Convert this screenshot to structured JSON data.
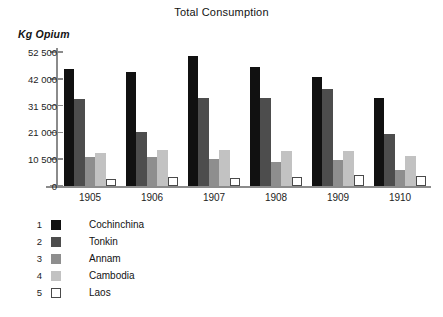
{
  "chart_data": {
    "type": "bar",
    "title": "Total Consumption",
    "xlabel": "",
    "ylabel": "Kg Opium",
    "ylim": [
      0,
      52500
    ],
    "yticks": [
      0,
      10500,
      21000,
      31500,
      42000,
      52500
    ],
    "ytick_labels": [
      "0",
      "10 500",
      "21 000",
      "31 500",
      "42 000",
      "52 500"
    ],
    "grid": false,
    "legend_position": "below-left",
    "categories": [
      "1905",
      "1906",
      "1907",
      "1908",
      "1909",
      "1910"
    ],
    "series": [
      {
        "name": "Cochinchina",
        "number": "1",
        "color": "#111111",
        "values": [
          46000,
          44800,
          51000,
          46800,
          42800,
          34500
        ]
      },
      {
        "name": "Tonkin",
        "number": "2",
        "color": "#4d4d4d",
        "values": [
          34000,
          21000,
          34500,
          34300,
          38000,
          20200
        ]
      },
      {
        "name": "Annam",
        "number": "3",
        "color": "#8e8e8e",
        "values": [
          11300,
          11300,
          10500,
          9500,
          10000,
          6200
        ]
      },
      {
        "name": "Cambodia",
        "number": "4",
        "color": "#c2c2c2",
        "values": [
          12900,
          14200,
          14100,
          13900,
          13700,
          11700
        ]
      },
      {
        "name": "Laos",
        "number": "5",
        "color": "#ffffff",
        "values": [
          2900,
          3400,
          3200,
          3700,
          4300,
          4100
        ]
      }
    ]
  },
  "colors": {
    "axis": "#8b8b8b",
    "text": "#1a1a1a",
    "background": "#ffffff"
  }
}
